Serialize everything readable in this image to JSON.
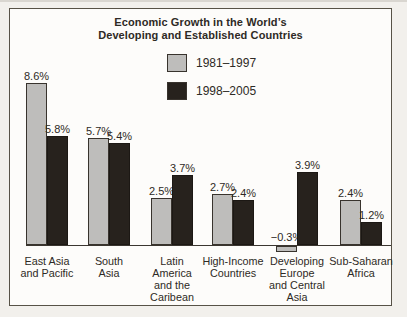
{
  "figure": {
    "page_background": "#f2f0ec",
    "box_background": "#fdfcfa",
    "box_border_color": "#575247",
    "text_color": "#2e2a25"
  },
  "chart_data": {
    "type": "bar",
    "title_lines": [
      "Economic Growth in the World’s",
      "Developing and Established Countries"
    ],
    "title": "Economic Growth in the World’s Developing and Established Countries",
    "categories": [
      "East Asia and Pacific",
      "South Asia",
      "Latin America and the Caribean",
      "High-Income Countries",
      "Developing Europe and Central Asia",
      "Sub-Saharan Africa"
    ],
    "category_label_lines": [
      [
        "East Asia",
        "and Pacific"
      ],
      [
        "South",
        "Asia"
      ],
      [
        "Latin",
        "America",
        "and the",
        "Caribean"
      ],
      [
        "High-Income",
        "Countries"
      ],
      [
        "Developing",
        "Europe",
        "and Central",
        "Asia"
      ],
      [
        "Sub-Saharan",
        "Africa"
      ]
    ],
    "series": [
      {
        "name": "1981–1997",
        "color": "#bebdbb",
        "border_color": "#38332d",
        "values": [
          8.6,
          5.7,
          2.5,
          2.7,
          -0.3,
          2.4
        ],
        "labels": [
          "8.6%",
          "5.7%",
          "2.5%",
          "2.7%",
          "−0.3%",
          "2.4%"
        ]
      },
      {
        "name": "1998–2005",
        "color": "#27221d",
        "border_color": "#1c1814",
        "values": [
          5.8,
          5.4,
          3.7,
          2.4,
          3.9,
          1.2
        ],
        "labels": [
          "5.8%",
          "5.4%",
          "3.7%",
          "2.4%",
          "3.9%",
          "1.2%"
        ]
      }
    ],
    "unit": "percent",
    "xlabel": "",
    "ylabel": "",
    "ylim": [
      -0.5,
      9.2
    ],
    "grid": false,
    "y_axis_shown": false,
    "baseline": 0,
    "legend_position": "upper-center"
  }
}
